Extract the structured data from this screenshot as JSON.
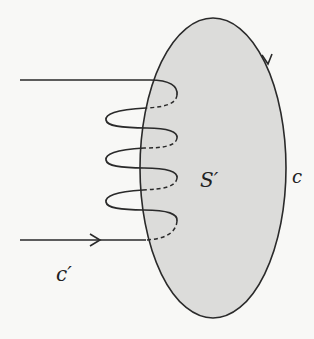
{
  "figure": {
    "labels": {
      "surface": "S′",
      "boundary_curve": "c",
      "coil_curve": "c′"
    },
    "colors": {
      "surface_fill": "#dcdcda",
      "stroke": "#2a2a2a",
      "background": "#f8f8f6"
    }
  }
}
